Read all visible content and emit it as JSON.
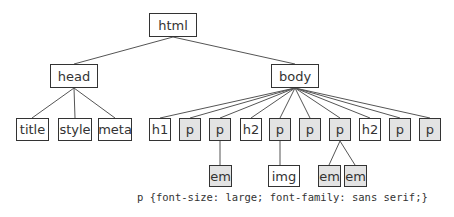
{
  "diagram": {
    "nodes": {
      "html": {
        "label": "html"
      },
      "head": {
        "label": "head"
      },
      "body": {
        "label": "body"
      },
      "title": {
        "label": "title"
      },
      "style": {
        "label": "style"
      },
      "meta": {
        "label": "meta"
      },
      "h1": {
        "label": "h1"
      },
      "p1": {
        "label": "p"
      },
      "p2": {
        "label": "p"
      },
      "h2a": {
        "label": "h2"
      },
      "p3": {
        "label": "p"
      },
      "p4": {
        "label": "p"
      },
      "p5": {
        "label": "p"
      },
      "h2b": {
        "label": "h2"
      },
      "p6": {
        "label": "p"
      },
      "p7": {
        "label": "p"
      },
      "em1": {
        "label": "em"
      },
      "img": {
        "label": "img"
      },
      "em2": {
        "label": "em"
      },
      "em3": {
        "label": "em"
      }
    },
    "edges": [
      [
        "html",
        "head"
      ],
      [
        "html",
        "body"
      ],
      [
        "head",
        "title"
      ],
      [
        "head",
        "style"
      ],
      [
        "head",
        "meta"
      ],
      [
        "body",
        "h1"
      ],
      [
        "body",
        "p1"
      ],
      [
        "body",
        "p2"
      ],
      [
        "body",
        "h2a"
      ],
      [
        "body",
        "p3"
      ],
      [
        "body",
        "p4"
      ],
      [
        "body",
        "p5"
      ],
      [
        "body",
        "h2b"
      ],
      [
        "body",
        "p6"
      ],
      [
        "body",
        "p7"
      ],
      [
        "p2",
        "em1"
      ],
      [
        "p3",
        "img"
      ],
      [
        "p5",
        "em2"
      ],
      [
        "p5",
        "em3"
      ]
    ],
    "highlighted": [
      "p1",
      "p2",
      "p3",
      "p4",
      "p5",
      "p6",
      "p7",
      "em1",
      "em2",
      "em3"
    ],
    "highlight_color": "#e3e3e3",
    "css_rule": "p {font-size: large; font-family: sans serif;}"
  }
}
